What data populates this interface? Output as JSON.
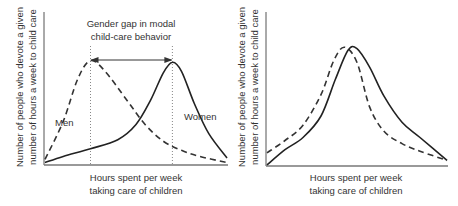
{
  "chart_data": [
    {
      "type": "line",
      "title": "",
      "xlabel": [
        "Hours spent per week",
        "taking care of children"
      ],
      "ylabel": [
        "Number of people who devote a given",
        "number of hours a week to child care"
      ],
      "xlim": [
        0,
        10
      ],
      "ylim": [
        0,
        10
      ],
      "grid": false,
      "annotation": {
        "text": [
          "Gender gap in modal",
          "child-care behavior"
        ],
        "from_x": 2.5,
        "to_x": 7.0
      },
      "series": [
        {
          "name": "Men",
          "style": "dashed",
          "label": "Men",
          "points": [
            [
              0,
              0.3
            ],
            [
              1,
              2.8
            ],
            [
              1.8,
              5.6
            ],
            [
              2.5,
              6.8
            ],
            [
              3.3,
              6.1
            ],
            [
              4.5,
              4.2
            ],
            [
              5.5,
              2.6
            ],
            [
              6.5,
              1.5
            ],
            [
              7.5,
              0.9
            ],
            [
              8.5,
              0.5
            ],
            [
              10,
              0.1
            ]
          ]
        },
        {
          "name": "Women",
          "style": "solid",
          "label": "Women",
          "points": [
            [
              0,
              0.1
            ],
            [
              1,
              0.5
            ],
            [
              2.5,
              1.0
            ],
            [
              4.0,
              1.6
            ],
            [
              5.0,
              2.6
            ],
            [
              5.8,
              4.2
            ],
            [
              6.5,
              6.0
            ],
            [
              7.0,
              6.7
            ],
            [
              7.5,
              6.1
            ],
            [
              8.2,
              4.0
            ],
            [
              9.0,
              2.0
            ],
            [
              10,
              0.4
            ]
          ]
        }
      ]
    },
    {
      "type": "line",
      "title": "",
      "xlabel": [
        "Hours spent per week",
        "taking care of children"
      ],
      "ylabel": [
        "Number of people who devote a given",
        "number of hours a week to child care"
      ],
      "xlim": [
        0,
        10
      ],
      "ylim": [
        0,
        10
      ],
      "grid": false,
      "series": [
        {
          "name": "Men",
          "style": "dashed",
          "points": [
            [
              0,
              0.8
            ],
            [
              1,
              1.6
            ],
            [
              2,
              2.6
            ],
            [
              3,
              4.6
            ],
            [
              3.7,
              6.8
            ],
            [
              4.3,
              7.7
            ],
            [
              5.0,
              6.7
            ],
            [
              5.7,
              3.8
            ],
            [
              6.5,
              2.2
            ],
            [
              7.5,
              1.4
            ],
            [
              8.5,
              0.9
            ],
            [
              10,
              0.3
            ]
          ]
        },
        {
          "name": "Women",
          "style": "solid",
          "points": [
            [
              0,
              0.0
            ],
            [
              1,
              1.0
            ],
            [
              2,
              1.8
            ],
            [
              3,
              3.2
            ],
            [
              3.8,
              5.6
            ],
            [
              4.5,
              7.5
            ],
            [
              5.0,
              7.6
            ],
            [
              5.7,
              6.4
            ],
            [
              6.5,
              4.5
            ],
            [
              7.5,
              2.8
            ],
            [
              8.5,
              1.8
            ],
            [
              10,
              0.3
            ]
          ]
        }
      ]
    }
  ]
}
